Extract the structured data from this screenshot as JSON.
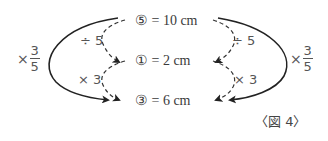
{
  "figure": {
    "caption": "〈図 4〉",
    "rows": [
      {
        "label": "⑤ = 10 cm"
      },
      {
        "label": "① = 2 cm"
      },
      {
        "label": "③ = 6 cm"
      }
    ],
    "left": {
      "step1": "÷ 5",
      "step2": "× 3",
      "combined": {
        "times": "×",
        "numerator": "3",
        "denominator": "5"
      }
    },
    "right": {
      "step1": "÷ 5",
      "step2": "× 3",
      "combined": {
        "times": "×",
        "numerator": "3",
        "denominator": "5"
      }
    },
    "colors": {
      "solid_arrow": "#222222",
      "dashed_arrow": "#333333",
      "text": "#3a3a3a"
    }
  }
}
